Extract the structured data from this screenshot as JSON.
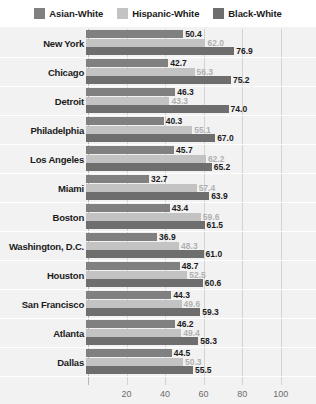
{
  "chart_data": {
    "type": "bar",
    "orientation": "horizontal",
    "title": "",
    "subtitle": "",
    "xlabel": "",
    "ylabel": "",
    "xlim": [
      0,
      110
    ],
    "xticks": [
      "20",
      "40",
      "60",
      "80",
      "100"
    ],
    "xtick_values": [
      20,
      40,
      60,
      80,
      100
    ],
    "grid": true,
    "legend_position": "top",
    "categories": [
      "New York",
      "Chicago",
      "Detroit",
      "Philadelphia",
      "Los Angeles",
      "Miami",
      "Boston",
      "Washington, D.C.",
      "Houston",
      "San Francisco",
      "Atlanta",
      "Dallas"
    ],
    "series": [
      {
        "name": "Asian-White",
        "color": "#808080",
        "values": [
          50.4,
          42.7,
          46.3,
          40.3,
          45.7,
          32.7,
          43.4,
          36.9,
          48.7,
          44.3,
          46.2,
          44.5
        ],
        "labels": [
          "50.4",
          "42.7",
          "46.3",
          "40.3",
          "45.7",
          "32.7",
          "43.4",
          "36.9",
          "48.7",
          "44.3",
          "46.2",
          "44.5"
        ],
        "label_color": "#1b1b1b"
      },
      {
        "name": "Hispanic-White",
        "color": "#c3c3c3",
        "values": [
          62.0,
          56.3,
          43.3,
          55.1,
          62.2,
          57.4,
          59.6,
          48.3,
          52.5,
          49.6,
          49.4,
          50.3
        ],
        "labels": [
          "62.0",
          "56.3",
          "43.3",
          "55.1",
          "62.2",
          "57.4",
          "59.6",
          "48.3",
          "52.5",
          "49.6",
          "49.4",
          "50.3"
        ],
        "label_color": "#b0b0b0"
      },
      {
        "name": "Black-White",
        "color": "#6e6e6e",
        "values": [
          76.9,
          75.2,
          74.0,
          67.0,
          65.2,
          63.9,
          61.5,
          61.0,
          60.6,
          59.3,
          58.3,
          55.5
        ],
        "labels": [
          "76.9",
          "75.2",
          "74.0",
          "67.0",
          "65.2",
          "63.9",
          "61.5",
          "61.0",
          "60.6",
          "59.3",
          "58.3",
          "55.5"
        ],
        "label_color": "#1b1b1b"
      }
    ]
  },
  "legend": {
    "items": [
      {
        "label": "Asian-White",
        "color": "#808080"
      },
      {
        "label": "Hispanic-White",
        "color": "#c3c3c3"
      },
      {
        "label": "Black-White",
        "color": "#6e6e6e"
      }
    ]
  },
  "colors": {
    "plot_background": "#f2f2f2",
    "page_background": "#ffffff",
    "gridline": "#d3d3d3",
    "axis": "#b6b6b6",
    "tick_text": "#6d6d6d",
    "category_text": "#1b1b1b"
  }
}
